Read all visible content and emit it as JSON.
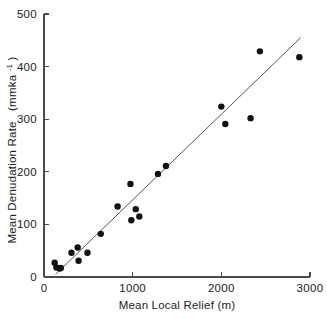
{
  "chart_data": {
    "type": "scatter",
    "title": "",
    "xlabel": "Mean  Local   Relief  (m)",
    "ylabel_main": "Mean  Denudation  Rate",
    "ylabel_units_open": "(mmka",
    "ylabel_units_exp": "-1",
    "ylabel_units_close": ")",
    "ylabel_full": "Mean Denudation Rate (mmka-1)",
    "xlim": [
      0,
      3000
    ],
    "ylim": [
      0,
      500
    ],
    "xticks": [
      0,
      1000,
      2000,
      3000
    ],
    "yticks": [
      0,
      100,
      200,
      300,
      400,
      500
    ],
    "xtick_labels": [
      "0",
      "1000",
      "2000",
      "3000"
    ],
    "ytick_labels": [
      "0",
      "100",
      "200",
      "300",
      "400",
      "500"
    ],
    "grid": false,
    "legend": false,
    "marker_color": "#111111",
    "line_color": "#555555",
    "axis_color": "#4a4a4a",
    "points": [
      {
        "x": 120,
        "y": 27
      },
      {
        "x": 140,
        "y": 18
      },
      {
        "x": 175,
        "y": 16
      },
      {
        "x": 190,
        "y": 17
      },
      {
        "x": 310,
        "y": 46
      },
      {
        "x": 380,
        "y": 56
      },
      {
        "x": 390,
        "y": 31
      },
      {
        "x": 490,
        "y": 46
      },
      {
        "x": 640,
        "y": 82
      },
      {
        "x": 830,
        "y": 134
      },
      {
        "x": 975,
        "y": 177
      },
      {
        "x": 985,
        "y": 108
      },
      {
        "x": 1035,
        "y": 129
      },
      {
        "x": 1075,
        "y": 115
      },
      {
        "x": 1285,
        "y": 196
      },
      {
        "x": 1375,
        "y": 211
      },
      {
        "x": 2000,
        "y": 324
      },
      {
        "x": 2045,
        "y": 291
      },
      {
        "x": 2330,
        "y": 302
      },
      {
        "x": 2435,
        "y": 429
      },
      {
        "x": 2880,
        "y": 418
      }
    ],
    "trend_line": {
      "x_start": 130,
      "y_start": 5,
      "x_end": 2895,
      "y_end": 455
    },
    "marker_radius_px": 3.2,
    "n_points": 21
  }
}
